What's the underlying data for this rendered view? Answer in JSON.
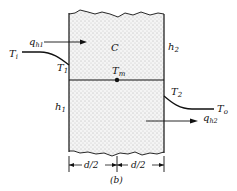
{
  "figure": {
    "caption": "(b)",
    "labels": {
      "Ti": "T",
      "Ti_sub": "i",
      "qh1": "q",
      "qh1_sub": "h1",
      "C": "C",
      "h2": "h",
      "h2_sub": "2",
      "T1": "T",
      "T1_sub": "1",
      "Tm": "T",
      "Tm_sub": "m",
      "T2": "T",
      "T2_sub": "2",
      "h1": "h",
      "h1_sub": "1",
      "To": "T",
      "To_sub": "o",
      "qh2": "q",
      "qh2_sub": "h2",
      "d_left": "d/2",
      "d_right": "d/2"
    }
  }
}
